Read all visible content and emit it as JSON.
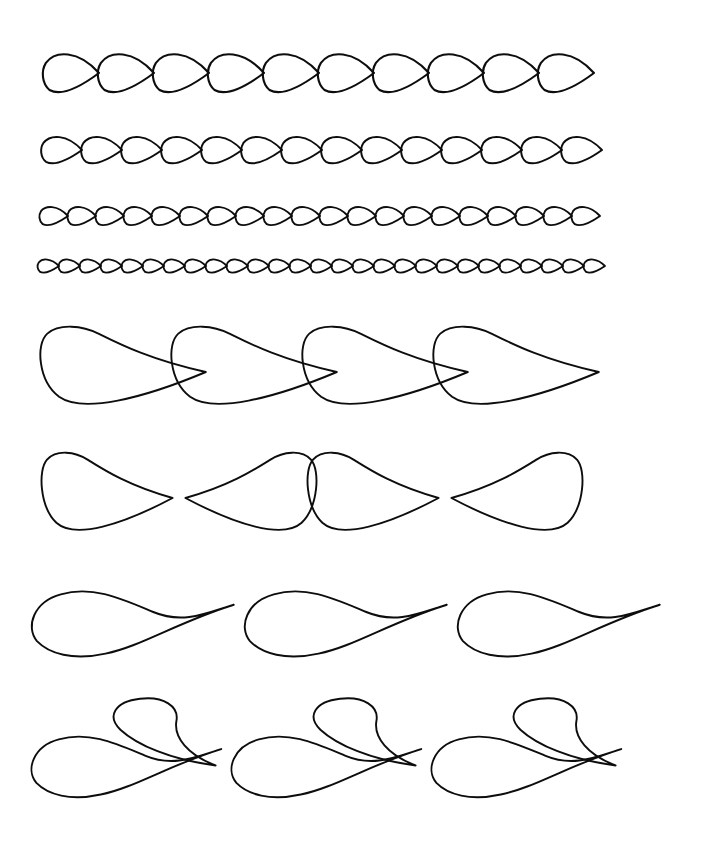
{
  "document": {
    "title": "Decorative Feather Border Pattern Sheet",
    "kind": "line-art-reference-sheet",
    "background_color": "#ffffff",
    "stroke_color": "#0d0d0d",
    "width": 701,
    "height": 844,
    "row_count": 8
  },
  "rows": [
    {
      "index": 1,
      "name": "teardrop-chain-large",
      "label": "Large teardrop chain border",
      "motif": "teardrop",
      "repeat_count": 10,
      "unit_width": 55,
      "amplitude": 23,
      "start_x": 44,
      "end_x": 602,
      "baseline_y": 73,
      "stroke_width": 2.1,
      "direction": "points-right",
      "terminator": "sharp-tip"
    },
    {
      "index": 2,
      "name": "teardrop-chain-medium",
      "label": "Medium teardrop chain border",
      "motif": "teardrop",
      "repeat_count": 14,
      "unit_width": 40,
      "amplitude": 16,
      "start_x": 42,
      "end_x": 604,
      "baseline_y": 150,
      "stroke_width": 2.0,
      "direction": "points-right",
      "terminator": "sharp-tip"
    },
    {
      "index": 3,
      "name": "teardrop-chain-small",
      "label": "Small teardrop chain border",
      "motif": "teardrop",
      "repeat_count": 20,
      "unit_width": 28,
      "amplitude": 11,
      "start_x": 40,
      "end_x": 600,
      "baseline_y": 216,
      "stroke_width": 1.9,
      "direction": "points-right",
      "terminator": "sharp-tip"
    },
    {
      "index": 4,
      "name": "teardrop-chain-fine",
      "label": "Fine teardrop chain border",
      "motif": "teardrop",
      "repeat_count": 27,
      "unit_width": 21,
      "amplitude": 8,
      "start_x": 38,
      "end_x": 605,
      "baseline_y": 266,
      "stroke_width": 1.8,
      "direction": "points-right",
      "terminator": "sharp-tip"
    },
    {
      "index": 5,
      "name": "feather-plume-right",
      "label": "Right-facing feather plume border",
      "motif": "feather-plume",
      "repeat_count": 4,
      "unit_width": 131,
      "amplitude": 40,
      "start_x": 46,
      "end_x": 578,
      "baseline_y": 372,
      "stroke_width": 1.9,
      "direction": "points-right",
      "terminator": "tapered-point"
    },
    {
      "index": 6,
      "name": "feather-plume-mirrored",
      "label": "Mirrored feather plume border",
      "motif": "feather-plume-pair",
      "repeat_count": 2,
      "unit_width": 266,
      "amplitude": 40,
      "start_x": 46,
      "end_x": 578,
      "baseline_y": 498,
      "stroke_width": 1.9,
      "direction": "mirrored-pairs",
      "terminator": "rounded-bulb"
    },
    {
      "index": 7,
      "name": "scroll-plume-long",
      "label": "Long S-scroll plume border",
      "motif": "s-scroll-plume",
      "repeat_count": 3,
      "unit_width": 213,
      "amplitude": 52,
      "start_x": 28,
      "end_x": 676,
      "baseline_y": 638,
      "stroke_width": 1.9,
      "direction": "points-right",
      "terminator": "tapered-point"
    },
    {
      "index": 8,
      "name": "scroll-plume-with-hook",
      "label": "S-scroll plume with curled hook border",
      "motif": "s-scroll-plume-hook",
      "repeat_count": 3,
      "unit_width": 200,
      "amplitude": 78,
      "start_x": 28,
      "end_x": 640,
      "baseline_y": 780,
      "stroke_width": 1.9,
      "direction": "points-right",
      "terminator": "tapered-point"
    }
  ]
}
